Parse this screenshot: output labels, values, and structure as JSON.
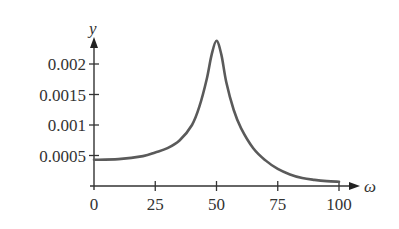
{
  "chart_data": {
    "type": "line",
    "title": "",
    "xlabel": "ω",
    "ylabel": "y",
    "xlim": [
      0,
      100
    ],
    "ylim": [
      0,
      0.0024
    ],
    "grid": false,
    "legend": null,
    "x_ticks": [
      "0",
      "25",
      "50",
      "75",
      "100"
    ],
    "y_ticks": [
      "0.0005",
      "0.001",
      "0.0015",
      "0.002"
    ],
    "series": [
      {
        "name": "y(ω)",
        "color": "#5a5a5a",
        "x": [
          0,
          10,
          20,
          25,
          30,
          35,
          40,
          43,
          46,
          48,
          50,
          52,
          54,
          57,
          60,
          65,
          70,
          75,
          80,
          85,
          90,
          95,
          100
        ],
        "values": [
          0.00043,
          0.00044,
          0.00049,
          0.00055,
          0.00062,
          0.00075,
          0.001,
          0.0013,
          0.00175,
          0.00215,
          0.00238,
          0.00215,
          0.0017,
          0.00125,
          0.00095,
          0.00062,
          0.00042,
          0.00028,
          0.00019,
          0.00013,
          0.0001,
          8e-05,
          7e-05
        ]
      }
    ]
  },
  "axes": {
    "x_label": "ω",
    "y_label": "y",
    "x_tick_labels": [
      "0",
      "25",
      "50",
      "75",
      "100"
    ],
    "y_tick_labels": [
      "0.0005",
      "0.001",
      "0.0015",
      "0.002"
    ]
  }
}
